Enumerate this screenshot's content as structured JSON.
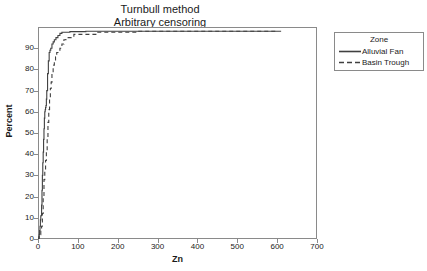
{
  "chart_data": {
    "type": "line",
    "title": "Turnbull method",
    "subtitle": "Arbitrary censoring",
    "xlabel": "Zn",
    "ylabel": "Percent",
    "xlim": [
      0,
      700
    ],
    "ylim": [
      0,
      100
    ],
    "xticks": [
      0,
      100,
      200,
      300,
      400,
      500,
      600,
      700
    ],
    "yticks": [
      0,
      10,
      20,
      30,
      40,
      50,
      60,
      70,
      80,
      90
    ],
    "grid": false,
    "legend_position": "right-outside",
    "legend_title": "Zone",
    "series": [
      {
        "name": "Alluvial Fan",
        "style": "solid",
        "color": "#404040",
        "x": [
          0,
          2,
          3,
          4,
          5,
          6,
          7,
          8,
          9,
          10,
          11,
          12,
          13,
          14,
          15,
          16,
          17,
          18,
          19,
          20,
          21,
          22,
          24,
          26,
          28,
          30,
          32,
          35,
          38,
          41,
          45,
          50,
          55,
          60,
          80,
          120,
          200,
          300,
          400,
          500,
          610
        ],
        "y": [
          0,
          1,
          2,
          4,
          6,
          9,
          11,
          11,
          16,
          23,
          30,
          36,
          41,
          47,
          52,
          57,
          60,
          61,
          62,
          63,
          66,
          70,
          78,
          84,
          88,
          89,
          90,
          92,
          93,
          94,
          95,
          96,
          97,
          97.5,
          97.8,
          98,
          98,
          98,
          98,
          98,
          98
        ]
      },
      {
        "name": "Basin Trough",
        "style": "dashed",
        "color": "#404040",
        "x": [
          0,
          3,
          5,
          7,
          9,
          11,
          13,
          15,
          17,
          19,
          21,
          23,
          25,
          27,
          29,
          31,
          33,
          35,
          38,
          41,
          44,
          47,
          50,
          55,
          60,
          65,
          70,
          90,
          150,
          250,
          350,
          450,
          550,
          600
        ],
        "y": [
          0,
          1,
          2,
          4,
          6,
          12,
          20,
          28,
          33,
          37,
          41,
          48,
          55,
          61,
          66,
          71,
          74,
          78,
          82,
          84,
          86,
          88,
          89,
          90,
          92,
          94,
          95,
          96.5,
          97.5,
          98,
          98,
          98,
          98,
          98
        ]
      }
    ]
  },
  "axis": {
    "x_tick_labels": [
      "0",
      "100",
      "200",
      "300",
      "400",
      "500",
      "600",
      "700"
    ],
    "y_tick_labels": [
      "0",
      "10",
      "20",
      "30",
      "40",
      "50",
      "60",
      "70",
      "80",
      "90"
    ],
    "x_title": "Zn",
    "y_title": "Percent"
  },
  "legend": {
    "title": "Zone",
    "entries": [
      {
        "label": "Alluvial Fan",
        "style": "solid"
      },
      {
        "label": "Basin Trough",
        "style": "dashed"
      }
    ]
  },
  "colors": {
    "line": "#404040",
    "frame": "#8a8a8a",
    "text": "#1a1a1a",
    "background": "#ffffff"
  }
}
